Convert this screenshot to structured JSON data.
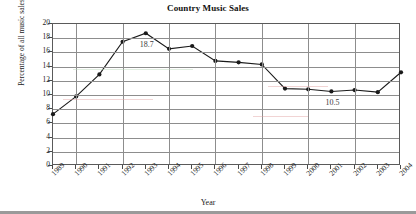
{
  "chart_data": {
    "type": "line",
    "title": "Country Music Sales",
    "xlabel": "Year",
    "ylabel": "Percentage of all music sales",
    "categories": [
      "1989",
      "1990",
      "1991",
      "1992",
      "1993",
      "1994",
      "1995",
      "1996",
      "1997",
      "1998",
      "1999",
      "2000",
      "2001",
      "2002",
      "2003",
      "2004"
    ],
    "values": [
      7.3,
      9.8,
      12.9,
      17.5,
      18.7,
      16.5,
      16.9,
      14.8,
      14.6,
      14.3,
      10.9,
      10.8,
      10.5,
      10.7,
      10.4,
      13.2
    ],
    "xlim": [
      "1989",
      "2004"
    ],
    "ylim": [
      0,
      20
    ],
    "ytick_step": 2,
    "yticks": [
      "20",
      "18",
      "16",
      "14",
      "12",
      "10",
      "8",
      "6",
      "4",
      "2",
      "0"
    ],
    "grid": true,
    "legend": "none",
    "series_color": "#1a1a1a",
    "marker": "filled-circle",
    "annotations": [
      {
        "label": "18.7",
        "category": "1993",
        "value": 18.7
      },
      {
        "label": "10.5",
        "category": "2001",
        "value": 10.5
      }
    ]
  },
  "figure": {
    "background_color": "#ffffff",
    "grid_color": "#8d8d8d",
    "frame_color": "#5a5a5a",
    "text_color": "#1a1a1a"
  }
}
